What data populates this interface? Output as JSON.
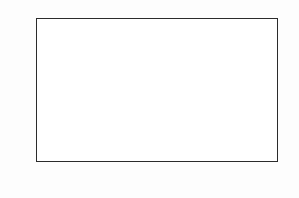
{
  "figure": {
    "background_color": "#ffffff",
    "frame_color": "#2b2b2b",
    "fill_color": "#b4b4b4",
    "line_color": "#1a1a1a",
    "curve_color": "#3a3a3a"
  },
  "axes": {
    "ylabel": "counts",
    "xlabel": "energy [keV]",
    "ytick_labels": [
      "0",
      "2",
      "4",
      "6",
      "8",
      "10",
      "12",
      "14",
      "16",
      "18",
      "20"
    ],
    "xtick_labels": [
      "2000",
      "2010",
      "2020",
      "2030",
      "2040",
      "2050",
      "2060",
      "2070",
      "2080"
    ]
  },
  "chart_data": {
    "type": "bar",
    "title": "",
    "subtitle": "",
    "xlabel": "energy [keV]",
    "ylabel": "counts",
    "xlim": [
      2000,
      2080
    ],
    "ylim": [
      0,
      20
    ],
    "ytick_values": [
      0,
      2,
      4,
      6,
      8,
      10,
      12,
      14,
      16,
      18,
      20
    ],
    "xtick_values": [
      2000,
      2010,
      2020,
      2030,
      2040,
      2050,
      2060,
      2070,
      2080
    ],
    "grid": false,
    "legend": "none",
    "bin_width": 1,
    "histogram_style": "step-filled",
    "x": [
      2000.5,
      2001.5,
      2002.5,
      2003.5,
      2004.5,
      2005.5,
      2006.5,
      2007.5,
      2008.5,
      2009.5,
      2010.5,
      2011.5,
      2012.5,
      2013.5,
      2014.5,
      2015.5,
      2016.5,
      2017.5,
      2018.5,
      2019.5,
      2020.5,
      2021.5,
      2022.5,
      2023.5,
      2024.5,
      2025.5,
      2026.5,
      2027.5,
      2028.5,
      2029.5,
      2030.5,
      2031.5,
      2032.5,
      2033.5,
      2034.5,
      2035.5,
      2036.5,
      2037.5,
      2038.5,
      2039.5,
      2040.5,
      2041.5,
      2042.5,
      2043.5,
      2044.5,
      2045.5,
      2046.5,
      2047.5,
      2048.5,
      2049.5,
      2050.5,
      2051.5,
      2052.5,
      2053.5,
      2054.5,
      2055.5,
      2056.5,
      2057.5,
      2058.5,
      2059.5,
      2060.5,
      2061.5,
      2062.5,
      2063.5,
      2064.5,
      2065.5,
      2066.5,
      2067.5,
      2068.5,
      2069.5,
      2070.5,
      2071.5,
      2072.5,
      2073.5,
      2074.5,
      2075.5,
      2076.5,
      2077.5,
      2078.5,
      2079.5
    ],
    "values": [
      8,
      8,
      2,
      4,
      4,
      6,
      7,
      8,
      11,
      12,
      13,
      12,
      8,
      7,
      11,
      8,
      12,
      7,
      9,
      11,
      12,
      9,
      5,
      5,
      4,
      8,
      9,
      9,
      8,
      9,
      9,
      6,
      3,
      6,
      7,
      8,
      7,
      8,
      11,
      5,
      11,
      5,
      5,
      6,
      4,
      7,
      6,
      5,
      5,
      8,
      9,
      13,
      12,
      11,
      8,
      7,
      6,
      5,
      5,
      5,
      6,
      11,
      10,
      13,
      12,
      10,
      8,
      7,
      6,
      5,
      7,
      10,
      8,
      7,
      9,
      7,
      7,
      7,
      7,
      8
    ],
    "overlay_curve": {
      "name": "gaussian-plus-background-fit",
      "shape": "gaussian",
      "x_range": [
        2032,
        2047
      ],
      "background_level": 5.2,
      "peak_center": 2039,
      "peak_amplitude": 4.3,
      "peak_height": 9.5,
      "sigma": 1.7
    }
  }
}
